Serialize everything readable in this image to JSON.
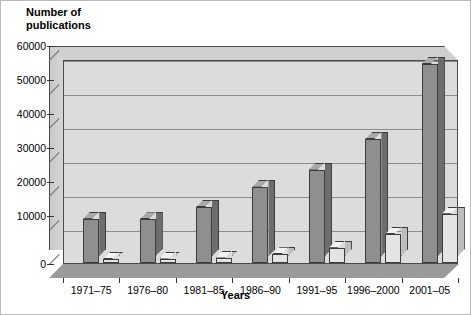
{
  "chart_data": {
    "type": "bar",
    "title": "Number of\npublications",
    "xlabel": "Years",
    "ylabel": "Number of publications",
    "categories": [
      "1971–75",
      "1976–80",
      "1981–85",
      "1986–90",
      "1991–95",
      "1996–2000",
      "2001–05"
    ],
    "series": [
      {
        "name": "series-a",
        "values": [
          13000,
          12800,
          16500,
          22500,
          27500,
          36500,
          58500
        ]
      },
      {
        "name": "series-b",
        "values": [
          1200,
          1300,
          1600,
          2600,
          4500,
          8500,
          14500
        ]
      }
    ],
    "ylim": [
      0,
      60000
    ],
    "yticks": [
      0,
      10000,
      20000,
      30000,
      40000,
      50000,
      60000
    ],
    "ytick_labels": [
      "0",
      "10000",
      "20000",
      "30000",
      "40000",
      "50000",
      "60000"
    ],
    "grid": true,
    "legend": false,
    "style": "3d-column",
    "colors": {
      "series_a_front": "#8f8f8f",
      "series_a_side": "#6d6d6d",
      "series_a_top": "#a9a9a9",
      "series_b_front": "#e4e4e4",
      "series_b_side": "#bdbdbd",
      "series_b_top": "#f2f2f2",
      "plot_background": "#dcdcdc",
      "floor": "#9a9a9a",
      "gridline": "#8d8d8d",
      "axis": "#333333"
    }
  }
}
